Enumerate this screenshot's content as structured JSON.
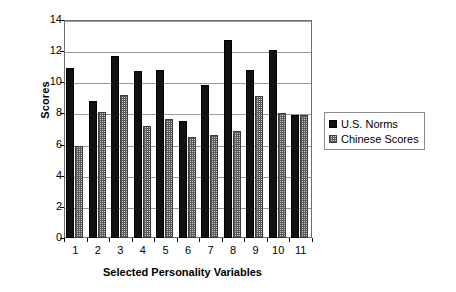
{
  "chart_data": {
    "type": "bar",
    "title": "",
    "xlabel": "Selected Personality Variables",
    "ylabel": "Scores",
    "categories": [
      "1",
      "2",
      "3",
      "4",
      "5",
      "6",
      "7",
      "8",
      "9",
      "10",
      "11"
    ],
    "series": [
      {
        "name": "U.S. Norms",
        "color": "#111111",
        "values": [
          10.9,
          8.8,
          11.7,
          10.7,
          10.8,
          7.5,
          9.8,
          12.7,
          10.8,
          12.1,
          7.9
        ]
      },
      {
        "name": "Chinese Scores",
        "color": "#c9c9c9",
        "values": [
          5.9,
          8.1,
          9.2,
          7.2,
          7.65,
          6.5,
          6.6,
          6.9,
          9.15,
          8.0,
          7.9
        ]
      }
    ],
    "ylim": [
      0,
      14
    ],
    "yticks": [
      0,
      2,
      4,
      6,
      8,
      10,
      12,
      14
    ],
    "ytick_labels": [
      "0",
      "2",
      "4",
      "6",
      "8",
      "10",
      "12",
      "14"
    ],
    "grid": true,
    "grid_axis": "y",
    "legend_position": "right"
  },
  "legend": {
    "entries": [
      {
        "label": "U.S. Norms",
        "swatch": "filled-square-icon"
      },
      {
        "label": "Chinese Scores",
        "swatch": "hatched-square-icon"
      }
    ]
  }
}
